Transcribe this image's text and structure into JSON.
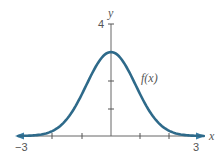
{
  "chart_data": {
    "type": "line",
    "title": "",
    "xlabel": "x",
    "ylabel": "y",
    "xlim": [
      -3,
      3
    ],
    "ylim": [
      0,
      4
    ],
    "grid": false,
    "x_tick_labels": [
      "-3",
      "3"
    ],
    "x_ticks": [
      -3,
      -2,
      -1,
      0,
      1,
      2,
      3
    ],
    "y_tick_labels": [
      "4"
    ],
    "y_ticks": [
      1,
      2,
      4
    ],
    "series": [
      {
        "name": "f(x)",
        "description": "Bell-shaped (Gaussian-like) curve peaking at x=0, y≈3",
        "x": [
          -3,
          -2.5,
          -2,
          -1.5,
          -1,
          -0.5,
          0,
          0.5,
          1,
          1.5,
          2,
          2.5,
          3
        ],
        "values": [
          0.03,
          0.13,
          0.4,
          0.98,
          1.82,
          2.65,
          3.0,
          2.65,
          1.82,
          0.98,
          0.4,
          0.13,
          0.03
        ]
      }
    ],
    "annotations": [
      {
        "text": "f(x)",
        "x": 1.1,
        "y": 2.0
      }
    ],
    "legend": "none",
    "colors": {
      "curve": "#2e6a8a",
      "axis": "#666666",
      "arrow": "#3a7fa6"
    }
  },
  "labels": {
    "x_axis": "x",
    "y_axis": "y",
    "x_min": "−3",
    "x_max": "3",
    "y_top": "4",
    "curve": "f(x)"
  }
}
